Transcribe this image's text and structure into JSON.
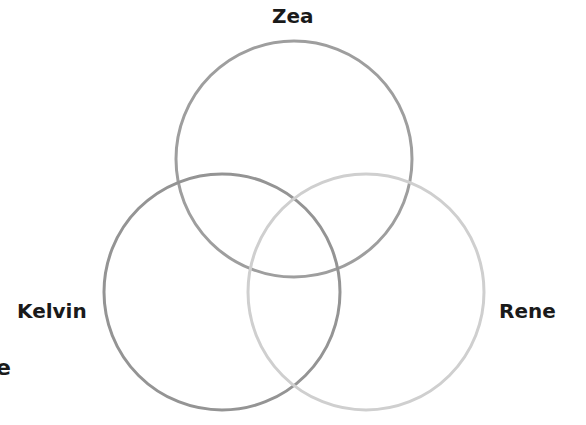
{
  "diagram": {
    "type": "venn",
    "sets": [
      {
        "name": "Zea",
        "cx": 294,
        "cy": 159,
        "r": 118,
        "stroke": "#9e9e9e"
      },
      {
        "name": "Kelvin",
        "cx": 222,
        "cy": 292,
        "r": 118,
        "stroke": "#949494"
      },
      {
        "name": "Rene",
        "cx": 366,
        "cy": 292,
        "r": 118,
        "stroke": "#cfcfcf"
      }
    ],
    "cut_off_text": "e"
  },
  "labels": {
    "zea": "Zea",
    "kelvin": "Kelvin",
    "rene": "Rene",
    "edge_fragment": "e"
  }
}
